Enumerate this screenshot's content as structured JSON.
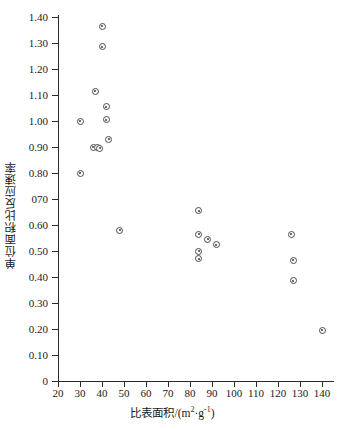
{
  "chart_data": {
    "type": "scatter",
    "title": "",
    "xlabel": "比表面积/(m²·g⁻¹)",
    "xlabel_parts": {
      "text": "比表面积/(m",
      "sup1": "2",
      "mid": "·g",
      "sup2": "-1",
      "tail": ")"
    },
    "ylabel": "单位面积比反应速率",
    "xlim": [
      20,
      145
    ],
    "ylim": [
      0,
      1.4
    ],
    "xticks": [
      20,
      30,
      40,
      50,
      60,
      70,
      80,
      90,
      100,
      110,
      120,
      130,
      140
    ],
    "xtick_labels": [
      "20",
      "30",
      "40",
      "50",
      "60",
      "70",
      "80",
      "90",
      "100",
      "110",
      "120",
      "130",
      "140"
    ],
    "yticks": [
      0,
      0.1,
      0.2,
      0.3,
      0.4,
      0.5,
      0.6,
      0.7,
      0.8,
      0.9,
      1.0,
      1.1,
      1.2,
      1.3,
      1.4
    ],
    "ytick_labels": [
      "0",
      "0.10",
      "0.20",
      "0.30",
      "0.40",
      "0.50",
      "0.60",
      "070",
      "0.80",
      "0.90",
      "1.00",
      "1.10",
      "1.20",
      "1.30",
      "1.40"
    ],
    "grid": false,
    "legend": false,
    "marker": "circle-dot",
    "marker_color": "#4a4a4a",
    "points": [
      {
        "x": 30,
        "y": 0.8
      },
      {
        "x": 30,
        "y": 1.0
      },
      {
        "x": 36,
        "y": 0.9
      },
      {
        "x": 37,
        "y": 1.115
      },
      {
        "x": 38,
        "y": 0.9
      },
      {
        "x": 39,
        "y": 0.895
      },
      {
        "x": 40,
        "y": 1.365
      },
      {
        "x": 40,
        "y": 1.285
      },
      {
        "x": 42,
        "y": 1.055
      },
      {
        "x": 42,
        "y": 1.005
      },
      {
        "x": 43,
        "y": 0.93
      },
      {
        "x": 48,
        "y": 0.58
      },
      {
        "x": 84,
        "y": 0.655
      },
      {
        "x": 84,
        "y": 0.565
      },
      {
        "x": 84,
        "y": 0.5
      },
      {
        "x": 84,
        "y": 0.47
      },
      {
        "x": 88,
        "y": 0.545
      },
      {
        "x": 92,
        "y": 0.525
      },
      {
        "x": 126,
        "y": 0.565
      },
      {
        "x": 127,
        "y": 0.465
      },
      {
        "x": 127,
        "y": 0.385
      },
      {
        "x": 140,
        "y": 0.195
      }
    ]
  }
}
